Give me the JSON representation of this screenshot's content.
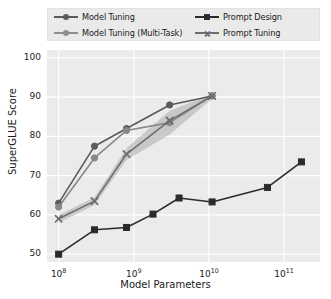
{
  "chart_data": {
    "type": "line",
    "title": "",
    "xlabel": "Model Parameters",
    "ylabel": "SuperGLUE Score",
    "xscale": "log",
    "xlim": [
      70000000,
      300000000000
    ],
    "ylim": [
      48,
      102
    ],
    "yticks": [
      50,
      60,
      70,
      80,
      90,
      100
    ],
    "xticks": [
      100000000,
      1000000000,
      10000000000,
      100000000000
    ],
    "xtick_labels": [
      "10^8",
      "10^9",
      "10^10",
      "10^11"
    ],
    "grid": true,
    "legend_position": "upper left outside",
    "series": [
      {
        "name": "Model Tuning",
        "marker": "circle",
        "color": "#5a5a5a",
        "x": [
          100000000,
          300000000,
          800000000,
          3000000000,
          11000000000
        ],
        "y": [
          63.0,
          77.5,
          82.0,
          88.0,
          90.3
        ]
      },
      {
        "name": "Model Tuning (Multi-Task)",
        "marker": "circle",
        "color": "#888888",
        "x": [
          100000000,
          300000000,
          800000000,
          3000000000,
          11000000000
        ],
        "y": [
          62.0,
          74.5,
          81.5,
          83.5,
          90.3
        ]
      },
      {
        "name": "Prompt Design",
        "marker": "square",
        "color": "#2b2b2b",
        "x": [
          100000000,
          300000000,
          800000000,
          1800000000,
          4000000000,
          11000000000,
          60000000000,
          170000000000
        ],
        "y": [
          50.0,
          56.2,
          56.8,
          60.2,
          64.3,
          63.3,
          67.0,
          73.5
        ]
      },
      {
        "name": "Prompt Tuning",
        "marker": "cross",
        "color": "#6d6d6d",
        "x": [
          100000000,
          300000000,
          800000000,
          3000000000,
          11000000000
        ],
        "y": [
          59.0,
          63.5,
          75.5,
          84.0,
          90.3
        ],
        "band_low": [
          58.0,
          62.5,
          74.0,
          80.5,
          89.6
        ],
        "band_high": [
          60.0,
          64.5,
          77.0,
          86.5,
          90.8
        ]
      }
    ]
  },
  "legend": {
    "items": [
      {
        "label": "Model Tuning"
      },
      {
        "label": "Prompt Design"
      },
      {
        "label": "Model Tuning (Multi-Task)"
      },
      {
        "label": "Prompt Tuning"
      }
    ]
  },
  "axes": {
    "y_tick_labels": [
      "100",
      "90",
      "80",
      "70",
      "60",
      "50"
    ],
    "x_tick_mantissa": [
      "10",
      "10",
      "10",
      "10"
    ],
    "x_tick_exponent": [
      "8",
      "9",
      "10",
      "11"
    ],
    "x_title": "Model Parameters",
    "y_title": "SuperGLUE Score"
  }
}
